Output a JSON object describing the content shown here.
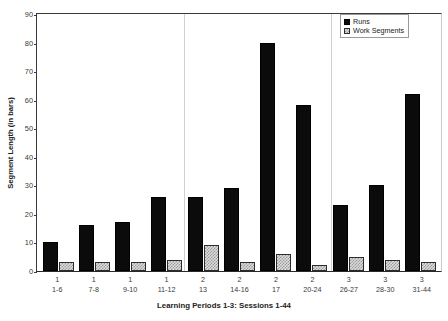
{
  "chart_data": {
    "type": "bar",
    "title": "",
    "xlabel": "Learning Periods 1-3: Sessions 1-44",
    "ylabel": "Segment Length (in bars)",
    "ylim": [
      0,
      90
    ],
    "yticks": [
      0,
      10,
      20,
      30,
      40,
      50,
      60,
      70,
      80,
      90
    ],
    "grid": false,
    "legend_position": "top-right",
    "categories": [
      "1-6",
      "7-8",
      "9-10",
      "11-12",
      "13",
      "14-16",
      "17",
      "20-24",
      "26-27",
      "28-30",
      "31-44"
    ],
    "period_numbers": [
      "1",
      "1",
      "1",
      "1",
      "2",
      "2",
      "2",
      "2",
      "3",
      "3",
      "3"
    ],
    "separators_after_index": [
      3,
      7
    ],
    "series": [
      {
        "name": "Runs",
        "color": "#0b0b0b",
        "values": [
          10,
          16,
          17,
          26,
          26,
          29,
          80,
          58,
          23,
          30,
          62
        ]
      },
      {
        "name": "Work Segments",
        "color": "#dcdcdc",
        "values": [
          3,
          3,
          3,
          4,
          9,
          3,
          6,
          2,
          5,
          4,
          3
        ]
      }
    ]
  },
  "legend": {
    "items": [
      {
        "label": "Runs",
        "swatch": "solid-black-swatch"
      },
      {
        "label": "Work Segments",
        "swatch": "hatched-gray-swatch"
      }
    ]
  }
}
